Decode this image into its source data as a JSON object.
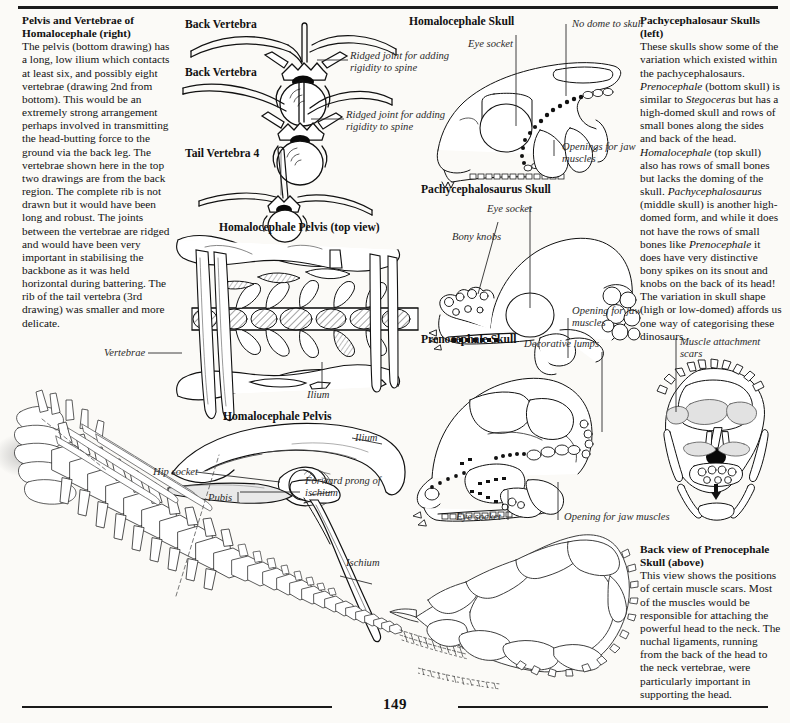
{
  "page": {
    "number": "149",
    "background": "#fbfaf7",
    "ink": "#111111"
  },
  "columns": {
    "left_text": {
      "heading": "Pelvis and Vertebrae of Homalocephale (right)",
      "body": "The pelvis (bottom drawing) has a long, low ilium which contacts at least six, and possibly eight vertebrae (drawing 2nd from bottom). This would be an extremely strong arrangement perhaps involved in transmitting the head-butting force to the ground via the back leg. The vertebrae shown here in the top two drawings are from the back region. The complete rib is not drawn but it would have been long and robust. The joints between the vertebrae are ridged and would have been very important in stabilising the backbone as it was held horizontal during battering. The rib of the tail vertebra (3rd drawing) was smaller and more delicate."
    },
    "right_text_top": {
      "heading": "Pachycephalosaur Skulls (left)",
      "body": "These skulls show some of the variation which existed within the pachycephalosaurs. Prenocephale (bottom skull) is similar to Stegoceras but has a high-domed skull and rows of small bones along the sides and back of the head. Homalocephale (top skull) also has rows of small bones but lacks the doming of the skull. Pachycephalosaurus (middle skull) is another high-domed form, and while it does not have the rows of small bones like Prenocephale it does have very distinctive bony spikes on its snout and knobs on the back of its head! The variation in skull shape (high or low-domed) affords us one way of categorising these dinosaurs."
    },
    "right_text_bottom": {
      "heading": "Back view of Prenocephale Skull (above)",
      "body": "This view shows the positions of certain muscle scars. Most of the muscles would be responsible for attaching the powerful head to the neck. The nuchal ligaments, running from the back of the head to the neck vertebrae, were particularly important in supporting the head."
    }
  },
  "figures": [
    {
      "id": "back-vertebra-1",
      "caption": "Back Vertebra"
    },
    {
      "id": "back-vertebra-2",
      "caption": "Back Vertebra"
    },
    {
      "id": "tail-vertebra-4",
      "caption": "Tail Vertebra 4"
    },
    {
      "id": "homalocephale-pelvis-top",
      "caption": "Homalocephale Pelvis  (top view)"
    },
    {
      "id": "homalocephale-pelvis-side",
      "caption": "Homalocephale Pelvis"
    },
    {
      "id": "homalocephale-skull",
      "caption": "Homalocephale Skull"
    },
    {
      "id": "pachycephalosaurus-skull",
      "caption": "Pachycephalosaurus Skull"
    },
    {
      "id": "prenocephale-skull",
      "caption": "Prenocephale Skull"
    }
  ],
  "annotations": {
    "ridged_joint_1": "Ridged joint for adding rigidity to spine",
    "ridged_joint_2": "Ridged joint for adding rigidity to spine",
    "vertebrae": "Vertebrae",
    "ilium_top_view": "Ilium",
    "ilium_side": "Ilium",
    "hip_socket": "Hip socket",
    "pubis": "Pubis",
    "forward_prong": "Forward prong of ischium",
    "ischium": "Ischium",
    "eye_socket_homalocephale": "Eye socket",
    "no_dome": "No dome to skull",
    "openings_jaw_homalocephale": "Openings for jaw muscles",
    "eye_socket_pachy": "Eye socket",
    "bony_knobs": "Bony knobs",
    "opening_jaw_pachy": "Opening for jaw muscles",
    "decorative_lumps": "Decorative lumps",
    "eye_socket_preno": "Eye socket",
    "opening_jaw_preno": "Opening for jaw muscles",
    "muscle_scars": "Muscle attachment scars"
  }
}
